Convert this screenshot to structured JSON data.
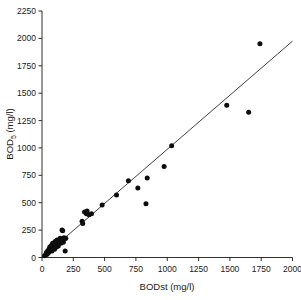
{
  "chart_data": {
    "type": "scatter",
    "title": "",
    "xlabel": "BODst (mg/l)",
    "ylabel": "BOD5 (mg/l)",
    "ylabel_base": "BOD",
    "ylabel_subscript": "5",
    "ylabel_unit": " (mg/l)",
    "xlim": [
      0,
      2000
    ],
    "ylim": [
      0,
      2250
    ],
    "xticks": [
      0,
      250,
      500,
      750,
      1000,
      1250,
      1500,
      1750,
      2000
    ],
    "yticks": [
      0,
      250,
      500,
      750,
      1000,
      1250,
      1500,
      1750,
      2000,
      2250
    ],
    "xtick_labels": [
      "0",
      "250",
      "500",
      "750",
      "1000",
      "1250",
      "1500",
      "1750",
      "2000"
    ],
    "ytick_labels": [
      "0",
      "250",
      "500",
      "750",
      "1000",
      "1250",
      "1500",
      "1750",
      "2000",
      "2250"
    ],
    "grid": false,
    "legend": false,
    "marker": "filled-circle",
    "marker_color": "#0d0d0d",
    "line_color": "#2b2b2b",
    "points": [
      [
        20,
        15
      ],
      [
        30,
        25
      ],
      [
        35,
        45
      ],
      [
        40,
        30
      ],
      [
        45,
        60
      ],
      [
        50,
        40
      ],
      [
        55,
        75
      ],
      [
        60,
        55
      ],
      [
        62,
        95
      ],
      [
        70,
        70
      ],
      [
        75,
        110
      ],
      [
        80,
        60
      ],
      [
        85,
        130
      ],
      [
        90,
        85
      ],
      [
        95,
        105
      ],
      [
        100,
        75
      ],
      [
        105,
        145
      ],
      [
        110,
        115
      ],
      [
        115,
        95
      ],
      [
        120,
        160
      ],
      [
        125,
        125
      ],
      [
        130,
        105
      ],
      [
        140,
        150
      ],
      [
        145,
        175
      ],
      [
        150,
        130
      ],
      [
        155,
        165
      ],
      [
        160,
        250
      ],
      [
        165,
        245
      ],
      [
        170,
        140
      ],
      [
        175,
        180
      ],
      [
        180,
        170
      ],
      [
        185,
        60
      ],
      [
        190,
        175
      ],
      [
        320,
        330
      ],
      [
        325,
        310
      ],
      [
        340,
        415
      ],
      [
        355,
        400
      ],
      [
        360,
        425
      ],
      [
        375,
        390
      ],
      [
        395,
        400
      ],
      [
        480,
        480
      ],
      [
        595,
        570
      ],
      [
        690,
        700
      ],
      [
        765,
        635
      ],
      [
        830,
        490
      ],
      [
        840,
        725
      ],
      [
        975,
        830
      ],
      [
        1035,
        1020
      ],
      [
        1475,
        1390
      ],
      [
        1650,
        1325
      ],
      [
        1740,
        1950
      ]
    ],
    "fit_line": {
      "description": "regression line through origin",
      "x_start": 0,
      "y_start": 0,
      "x_end": 2000,
      "y_end": 1975,
      "slope": 0.9875,
      "intercept": 0
    }
  }
}
